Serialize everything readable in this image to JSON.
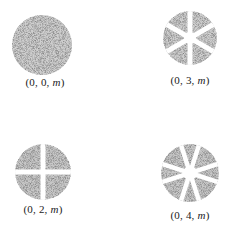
{
  "figure": {
    "background": "#ffffff",
    "stipple_color": "#555555",
    "panels": [
      {
        "id": "mode-0-0",
        "label": "(0, 0, m)",
        "prefix": "(0, 0, ",
        "var": "m",
        "suffix": ")",
        "wedges": 0,
        "cx": 42,
        "cy": 45,
        "r": 30,
        "label_x": 45,
        "label_y": 76
      },
      {
        "id": "mode-0-3",
        "label": "(0, 3, m)",
        "prefix": "(0, 3, ",
        "var": "m",
        "suffix": ")",
        "wedges": 6,
        "cx": 190,
        "cy": 38,
        "r": 27,
        "label_x": 190,
        "label_y": 74
      },
      {
        "id": "mode-0-2",
        "label": "(0, 2, m)",
        "prefix": "(0, 2, ",
        "var": "m",
        "suffix": ")",
        "wedges": 4,
        "cx": 43,
        "cy": 172,
        "r": 28,
        "label_x": 43,
        "label_y": 203
      },
      {
        "id": "mode-0-4",
        "label": "(0, 4, m)",
        "prefix": "(0, 4, ",
        "var": "m",
        "suffix": ")",
        "wedges": 8,
        "cx": 190,
        "cy": 173,
        "r": 29,
        "label_x": 190,
        "label_y": 209
      }
    ]
  }
}
